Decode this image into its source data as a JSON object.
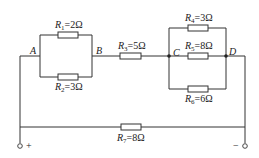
{
  "diagram": {
    "type": "circuit",
    "nodes": [
      {
        "id": "A",
        "label": "A"
      },
      {
        "id": "B",
        "label": "B"
      },
      {
        "id": "C",
        "label": "C"
      },
      {
        "id": "D",
        "label": "D"
      }
    ],
    "resistors": [
      {
        "id": "R1",
        "name": "R",
        "sub": "1",
        "value": "=2Ω",
        "between": [
          "A",
          "B"
        ],
        "branch": "upper"
      },
      {
        "id": "R2",
        "name": "R",
        "sub": "2",
        "value": "=3Ω",
        "between": [
          "A",
          "B"
        ],
        "branch": "lower"
      },
      {
        "id": "R3",
        "name": "R",
        "sub": "3",
        "value": "=5Ω",
        "between": [
          "B",
          "C"
        ]
      },
      {
        "id": "R4",
        "name": "R",
        "sub": "4",
        "value": "=3Ω",
        "between": [
          "C",
          "D"
        ],
        "branch": "upper"
      },
      {
        "id": "R5",
        "name": "R",
        "sub": "5",
        "value": "=8Ω",
        "between": [
          "C",
          "D"
        ],
        "branch": "middle"
      },
      {
        "id": "R6",
        "name": "R",
        "sub": "6",
        "value": "=6Ω",
        "between": [
          "C",
          "D"
        ],
        "branch": "lower"
      },
      {
        "id": "R7",
        "name": "R",
        "sub": "7",
        "value": "=8Ω",
        "between": [
          "+",
          "-"
        ]
      }
    ],
    "terminals": [
      {
        "id": "plus",
        "label": "+"
      },
      {
        "id": "minus",
        "label": "−"
      }
    ]
  }
}
